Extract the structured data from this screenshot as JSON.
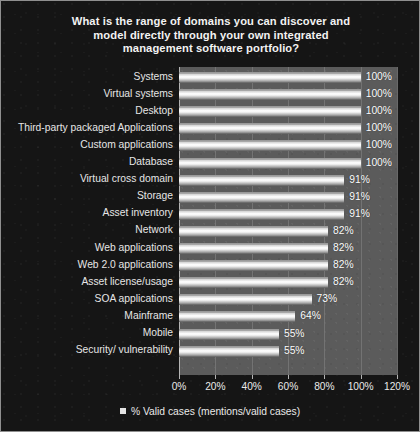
{
  "chart_data": {
    "type": "bar",
    "orientation": "horizontal",
    "title": "What is the range of domains you can discover and model directly through your own integrated management software portfolio?",
    "title_lines": [
      "What is the range of domains you can discover and",
      "model directly through your own integrated",
      "management software portfolio?"
    ],
    "xlabel": "",
    "ylabel": "",
    "xlim": [
      0,
      120
    ],
    "xticks": [
      0,
      20,
      40,
      60,
      80,
      100,
      120
    ],
    "xtick_labels": [
      "0%",
      "20%",
      "40%",
      "60%",
      "80%",
      "100%",
      "120%"
    ],
    "grid": true,
    "legend_position": "bottom",
    "legend": [
      "% Valid cases (mentions/valid cases)"
    ],
    "categories": [
      "Systems",
      "Virtual systems",
      "Desktop",
      "Third-party packaged Applications",
      "Custom applications",
      "Database",
      "Virtual cross domain",
      "Storage",
      "Asset inventory",
      "Network",
      "Web applications",
      "Web 2.0 applications",
      "Asset license/usage",
      "SOA applications",
      "Mainframe",
      "Mobile",
      "Security/ vulnerability"
    ],
    "values": [
      100,
      100,
      100,
      100,
      100,
      100,
      91,
      91,
      91,
      82,
      82,
      82,
      82,
      73,
      64,
      55,
      55
    ],
    "value_labels": [
      "100%",
      "100%",
      "100%",
      "100%",
      "100%",
      "100%",
      "91%",
      "91%",
      "91%",
      "82%",
      "82%",
      "82%",
      "82%",
      "73%",
      "64%",
      "55%",
      "55%"
    ],
    "series": [
      {
        "name": "% Valid cases (mentions/valid cases)",
        "values": [
          100,
          100,
          100,
          100,
          100,
          100,
          91,
          91,
          91,
          82,
          82,
          82,
          82,
          73,
          64,
          55,
          55
        ]
      }
    ]
  },
  "colors": {
    "background": "#151515",
    "plot_background": "#5b5b5b",
    "bar_fill": "#ffffff",
    "text": "#e9e9e9",
    "gridline": "#787878",
    "border": "#8f8f8f"
  },
  "legend_marker": "square-marker"
}
